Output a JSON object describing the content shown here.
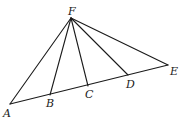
{
  "diagram": {
    "type": "geometry",
    "points": {
      "F": {
        "label": "F",
        "x": 71,
        "y": 18
      },
      "A": {
        "label": "A",
        "x": 10,
        "y": 104
      },
      "B": {
        "label": "B",
        "x": 50,
        "y": 95
      },
      "C": {
        "label": "C",
        "x": 88,
        "y": 86
      },
      "D": {
        "label": "D",
        "x": 128,
        "y": 75
      },
      "E": {
        "label": "E",
        "x": 168,
        "y": 65
      }
    },
    "segments": [
      [
        "F",
        "A"
      ],
      [
        "F",
        "B"
      ],
      [
        "F",
        "C"
      ],
      [
        "F",
        "D"
      ],
      [
        "F",
        "E"
      ],
      [
        "A",
        "E"
      ]
    ],
    "label_positions": {
      "F": {
        "x": 68,
        "y": 15
      },
      "A": {
        "x": 3,
        "y": 117
      },
      "B": {
        "x": 46,
        "y": 107
      },
      "C": {
        "x": 85,
        "y": 98
      },
      "D": {
        "x": 126,
        "y": 88
      },
      "E": {
        "x": 170,
        "y": 75
      }
    }
  }
}
